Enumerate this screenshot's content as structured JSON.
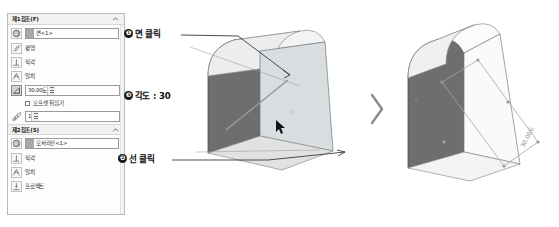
{
  "panel": {
    "sections": [
      {
        "id": "first-reference",
        "title": "제1참조(F)",
        "chevron_icon": "chevron-up-icon",
        "selection": {
          "icon": "plane-icon",
          "value": "면<1>"
        },
        "constraints": [
          {
            "icon": "parallel-icon",
            "label": "평행",
            "active": false
          },
          {
            "icon": "perpendicular-icon",
            "label": "직각",
            "active": false
          },
          {
            "icon": "coincident-icon",
            "label": "일치",
            "active": false
          }
        ],
        "angle": {
          "icon": "angle-icon",
          "value": "30.00도",
          "active": true,
          "spinner_icon": "spinner-icon"
        },
        "flip_offset": {
          "label": "오프셋 뒤집기",
          "checked": false
        },
        "count": {
          "icon": "num-planes-icon",
          "value": "1",
          "spinner_icon": "spinner-icon"
        }
      },
      {
        "id": "second-reference",
        "title": "제2참조(S)",
        "chevron_icon": "chevron-up-icon",
        "selection": {
          "icon": "plane-icon",
          "value": "모서리선<1>"
        },
        "constraints": [
          {
            "icon": "perpendicular-icon",
            "label": "직각",
            "active": false
          },
          {
            "icon": "coincident-icon",
            "label": "일치",
            "active": false
          },
          {
            "icon": "project-icon",
            "label": "프로젝트",
            "active": false
          }
        ]
      }
    ]
  },
  "callouts": [
    {
      "id": "click-face",
      "badge": "❶",
      "text": "면 클릭"
    },
    {
      "id": "click-line",
      "badge": "❷",
      "text": "선 클릭"
    },
    {
      "id": "angle-value",
      "badge": "❸",
      "text": "각도 : 30"
    }
  ],
  "separator": {
    "icon": "chevron-right-icon"
  },
  "models": {
    "left": {
      "name": "wedge-model-before",
      "description": "선택된 면과 모서리선이 강조된 경사 모델"
    },
    "right": {
      "name": "wedge-model-after",
      "description": "각도 기준면이 생성된 결과 모델",
      "dimension_label": "30.00도"
    }
  },
  "colors": {
    "panel_bg": "#fdfdfd",
    "panel_border": "#b9b9b9",
    "section_header_bg": "#f2f2f2",
    "field_border": "#9a9a9a",
    "active_field": "#d5d5d5",
    "model_face_light": "#e8e8e8",
    "model_face_mid": "#c9c9c9",
    "model_face_dark": "#6e6e6e",
    "leader_line": "#3c3c3c",
    "badge_bg": "#1a1a1a"
  }
}
